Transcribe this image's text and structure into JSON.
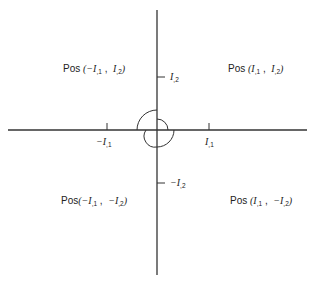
{
  "diagram": {
    "type": "coordinate-quadrant-diagram",
    "colors": {
      "stroke": "#333333",
      "text": "#222222",
      "background": "#ffffff"
    },
    "axes": {
      "horizontal": {
        "y": 130,
        "x_start": 8,
        "x_end": 307
      },
      "vertical": {
        "x": 157,
        "y_start": 10,
        "y_end": 275
      }
    },
    "ticks": {
      "neg_i1": {
        "label": "−I",
        "sub": ",1",
        "x": 107
      },
      "pos_i1": {
        "label": "I",
        "sub": ",1",
        "x": 209
      },
      "pos_i2": {
        "label": "I",
        "sub": ",2",
        "y": 77
      },
      "neg_i2": {
        "label": "−I",
        "sub": ",2",
        "y": 183
      }
    },
    "quadrants": {
      "top_left": {
        "prefix": "Pos ",
        "open": "(",
        "a": "−I",
        "a_sub": ",1",
        "sep": " ,  ",
        "b": "I",
        "b_sub": ",2",
        "close": ")"
      },
      "top_right": {
        "prefix": "Pos ",
        "open": "(",
        "a": "I",
        "a_sub": ",1",
        "sep": " ,  ",
        "b": "I",
        "b_sub": ",2",
        "close": ")"
      },
      "bottom_left": {
        "prefix": "Pos",
        "open": "(",
        "a": "−I",
        "a_sub": ",1",
        "sep": " ,  ",
        "b": "−I",
        "b_sub": ",2",
        "close": ")"
      },
      "bottom_right": {
        "prefix": "Pos ",
        "open": "(",
        "a": "I",
        "a_sub": ",1",
        "sep": " ,  ",
        "b": "−I",
        "b_sub": ",2",
        "close": ")"
      }
    },
    "arcs": [
      {
        "name": "large-arc-upper-left",
        "description": "semicircular arc from positive vertical axis through upper-left to horizontal axis"
      },
      {
        "name": "small-arc-right-lower",
        "description": "smaller arc looping around origin through right and lower quadrants"
      }
    ]
  }
}
